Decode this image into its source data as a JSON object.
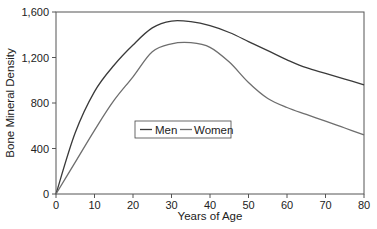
{
  "chart_data": {
    "type": "line",
    "title": "",
    "xlabel": "Years of Age",
    "ylabel": "Bone Mineral Density",
    "xlim": [
      0,
      80
    ],
    "ylim": [
      0,
      1600
    ],
    "xticks": [
      0,
      10,
      20,
      30,
      40,
      50,
      60,
      70,
      80
    ],
    "yticks": [
      0,
      400,
      800,
      1200,
      1600
    ],
    "ytick_labels": [
      "0",
      "400",
      "800",
      "1,200",
      "1,600"
    ],
    "xtick_labels": [
      "0",
      "10",
      "20",
      "30",
      "40",
      "50",
      "60",
      "70",
      "80"
    ],
    "grid": false,
    "legend": {
      "position": "inside-left-center",
      "entries": [
        "Men",
        "Women"
      ]
    },
    "x": [
      0,
      5,
      10,
      15,
      20,
      25,
      30,
      35,
      40,
      45,
      50,
      55,
      60,
      65,
      70,
      75,
      80
    ],
    "series": [
      {
        "name": "Men",
        "color": "#3a3a3a",
        "values": [
          0,
          540,
          900,
          1130,
          1310,
          1460,
          1520,
          1515,
          1480,
          1420,
          1340,
          1260,
          1180,
          1110,
          1060,
          1010,
          960
        ]
      },
      {
        "name": "Women",
        "color": "#6e6e6e",
        "values": [
          0,
          280,
          560,
          820,
          1030,
          1250,
          1320,
          1330,
          1290,
          1160,
          980,
          840,
          760,
          700,
          640,
          580,
          520
        ]
      }
    ]
  }
}
